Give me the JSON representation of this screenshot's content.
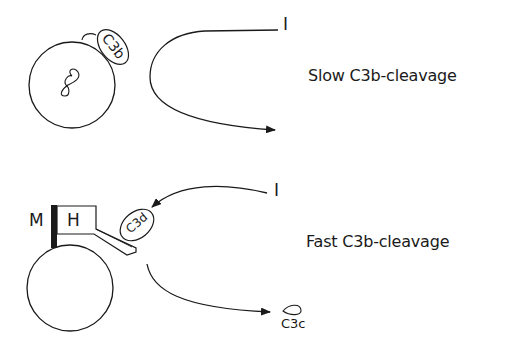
{
  "diagram": {
    "top_panel": {
      "caption": "Slow C3b-cleavage",
      "factor_label": "I",
      "bound_component": "C3b",
      "cell": "cell-circle"
    },
    "bottom_panel": {
      "caption": "Fast C3b-cleavage",
      "factor_label": "I",
      "membrane_label": "M",
      "cofactor_label": "H",
      "bound_component": "C3d",
      "released_fragment": "C3c",
      "cell": "cell-circle"
    },
    "colors": {
      "stroke": "#1a1a1a",
      "background": "#ffffff"
    }
  }
}
